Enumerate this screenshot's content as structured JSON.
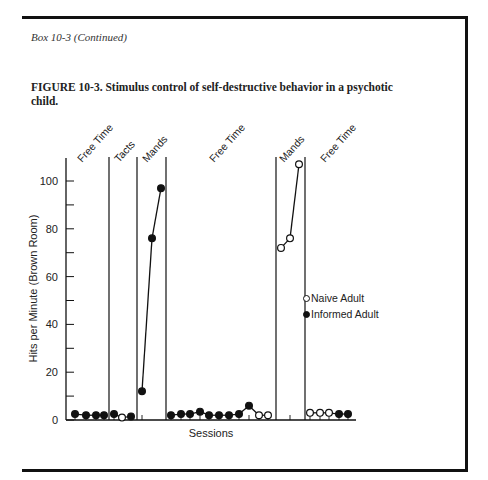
{
  "header": {
    "box_label": "Box 10-3 (Continued)",
    "caption": "FIGURE 10-3. Stimulus control of self-destructive behavior in a psychotic child."
  },
  "legend": {
    "items": [
      {
        "label": "Naive Adult",
        "marker": "open-circle"
      },
      {
        "label": "Informed Adult",
        "marker": "filled-circle"
      }
    ]
  },
  "chart_data": {
    "type": "line",
    "title": "FIGURE 10-3. Stimulus control of self-destructive behavior in a psychotic child.",
    "xlabel": "Sessions",
    "ylabel": "Hits per Minute (Brown Room)",
    "ylim": [
      0,
      110
    ],
    "yticks": [
      0,
      20,
      40,
      60,
      80,
      100
    ],
    "grid": false,
    "legend_position": "right",
    "phases": [
      "Free Time",
      "Tacts",
      "Mands",
      "Free Time",
      "Mands",
      "Free Time"
    ],
    "phase_boundaries_after_session": [
      4,
      7,
      10,
      21,
      24
    ],
    "sessions": [
      1,
      2,
      3,
      4,
      5,
      6,
      7,
      8,
      9,
      10,
      11,
      12,
      13,
      14,
      15,
      16,
      17,
      18,
      19,
      20,
      21,
      22,
      23,
      24,
      25,
      26,
      27,
      28,
      29
    ],
    "points": [
      {
        "session": 1,
        "value": 2.5,
        "series": "Informed Adult",
        "phase": "Free Time"
      },
      {
        "session": 2,
        "value": 2,
        "series": "Informed Adult",
        "phase": "Free Time"
      },
      {
        "session": 3,
        "value": 2,
        "series": "Informed Adult",
        "phase": "Free Time"
      },
      {
        "session": 4,
        "value": 2,
        "series": "Informed Adult",
        "phase": "Free Time"
      },
      {
        "session": 5,
        "value": 2.5,
        "series": "Informed Adult",
        "phase": "Tacts"
      },
      {
        "session": 6,
        "value": 1,
        "series": "Naive Adult",
        "phase": "Tacts"
      },
      {
        "session": 7,
        "value": 1.5,
        "series": "Informed Adult",
        "phase": "Tacts"
      },
      {
        "session": 8,
        "value": 12,
        "series": "Informed Adult",
        "phase": "Mands"
      },
      {
        "session": 9,
        "value": 76,
        "series": "Informed Adult",
        "phase": "Mands"
      },
      {
        "session": 10,
        "value": 97,
        "series": "Informed Adult",
        "phase": "Mands"
      },
      {
        "session": 11,
        "value": 2,
        "series": "Informed Adult",
        "phase": "Free Time"
      },
      {
        "session": 12,
        "value": 2.5,
        "series": "Informed Adult",
        "phase": "Free Time"
      },
      {
        "session": 13,
        "value": 2.5,
        "series": "Informed Adult",
        "phase": "Free Time"
      },
      {
        "session": 14,
        "value": 3.5,
        "series": "Informed Adult",
        "phase": "Free Time"
      },
      {
        "session": 15,
        "value": 2,
        "series": "Informed Adult",
        "phase": "Free Time"
      },
      {
        "session": 16,
        "value": 2,
        "series": "Informed Adult",
        "phase": "Free Time"
      },
      {
        "session": 17,
        "value": 2,
        "series": "Informed Adult",
        "phase": "Free Time"
      },
      {
        "session": 18,
        "value": 2.5,
        "series": "Informed Adult",
        "phase": "Free Time"
      },
      {
        "session": 19,
        "value": 6,
        "series": "Informed Adult",
        "phase": "Free Time"
      },
      {
        "session": 20,
        "value": 2,
        "series": "Naive Adult",
        "phase": "Free Time"
      },
      {
        "session": 21,
        "value": 2,
        "series": "Naive Adult",
        "phase": "Free Time"
      },
      {
        "session": 22,
        "value": 72,
        "series": "Naive Adult",
        "phase": "Mands"
      },
      {
        "session": 23,
        "value": 76,
        "series": "Naive Adult",
        "phase": "Mands"
      },
      {
        "session": 24,
        "value": 107,
        "series": "Naive Adult",
        "phase": "Mands"
      },
      {
        "session": 25,
        "value": 3,
        "series": "Naive Adult",
        "phase": "Free Time"
      },
      {
        "session": 26,
        "value": 3,
        "series": "Naive Adult",
        "phase": "Free Time"
      },
      {
        "session": 27,
        "value": 3,
        "series": "Naive Adult",
        "phase": "Free Time"
      },
      {
        "session": 28,
        "value": 2.5,
        "series": "Informed Adult",
        "phase": "Free Time"
      },
      {
        "session": 29,
        "value": 2.5,
        "series": "Informed Adult",
        "phase": "Free Time"
      }
    ],
    "series": [
      {
        "name": "Naive Adult",
        "marker": "open-circle"
      },
      {
        "name": "Informed Adult",
        "marker": "filled-circle"
      }
    ]
  }
}
